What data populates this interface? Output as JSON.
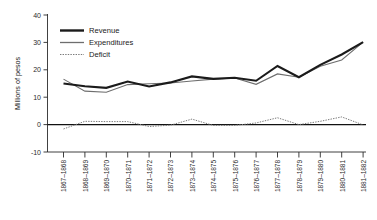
{
  "chart_data": {
    "type": "line",
    "title": "",
    "subtitle": "",
    "xlabel": "",
    "ylabel": "Millions of pesos",
    "ylim": [
      -10,
      40
    ],
    "yticks": [
      -10,
      0,
      10,
      20,
      30,
      40
    ],
    "ytick_labels": [
      "-10",
      "0",
      "10",
      "20",
      "30",
      "40"
    ],
    "grid": false,
    "legend_position": "upper-left",
    "zero_reference_line": true,
    "categories": [
      "1867–1868",
      "1868–1869",
      "1869–1870",
      "1870–1871",
      "1871–1872",
      "1872–1873",
      "1873–1874",
      "1874–1875",
      "1875–1876",
      "1876–1877",
      "1877–1878",
      "1878–1879",
      "1879–1880",
      "1880–1881",
      "1881–1882"
    ],
    "series": [
      {
        "name": "Revenue",
        "color": "#1b1b1b",
        "style": "solid-thick",
        "values": [
          15.0,
          14.0,
          13.4,
          15.7,
          13.9,
          15.4,
          17.6,
          16.7,
          17.1,
          16.0,
          21.4,
          17.3,
          21.8,
          25.6,
          30.1
        ]
      },
      {
        "name": "Expenditures",
        "color": "#6e6e6e",
        "style": "solid-thin",
        "values": [
          16.6,
          12.2,
          11.8,
          14.6,
          14.9,
          15.2,
          15.9,
          16.6,
          17.0,
          14.7,
          18.5,
          17.3,
          21.3,
          23.6,
          30.1
        ]
      },
      {
        "name": "Deficit",
        "color": "#7a7a7a",
        "style": "dotted",
        "values": [
          -1.6,
          1.2,
          1.1,
          1.1,
          -0.7,
          -0.2,
          2.0,
          -0.3,
          -0.3,
          0.6,
          2.5,
          0.0,
          1.2,
          2.8,
          -0.1
        ]
      }
    ]
  },
  "legend": {
    "items": [
      {
        "label": "Revenue"
      },
      {
        "label": "Expenditures"
      },
      {
        "label": "Deficit"
      }
    ]
  }
}
